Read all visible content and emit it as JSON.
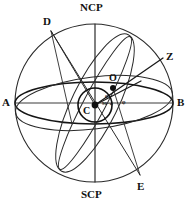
{
  "figure": {
    "type": "celestial-sphere-diagram",
    "background": "#ffffff",
    "stroke_color": "#1a1a1a",
    "canvas": {
      "width": 189,
      "height": 204
    }
  },
  "labels": {
    "ncp": "NCP",
    "scp": "SCP",
    "a": "A",
    "b": "B",
    "c": "C",
    "d": "D",
    "e": "E",
    "o": "O",
    "z": "Z",
    "phi_upper": "φ",
    "phi_right": "φ",
    "ninety_minus_phi": "90−φ"
  },
  "geometry": {
    "sphere": {
      "cx": 94,
      "cy": 103,
      "r": 79
    },
    "inner_circle": {
      "cx": 95,
      "cy": 105,
      "r": 17
    },
    "equator_ellipse": {
      "cx": 94,
      "cy": 103,
      "rx": 79,
      "ry": 21
    },
    "horizon_ellipse": {
      "cx": 94,
      "cy": 103,
      "rx": 79,
      "ry": 27,
      "rotation": -7
    },
    "ecliptic_ellipse": {
      "cx": 95,
      "cy": 103,
      "rx": 76,
      "ry": 22,
      "rotation": -64
    },
    "polar_axis": {
      "x1": 95,
      "y1": 24,
      "x2": 95,
      "y2": 182
    },
    "equator_line": {
      "x1": 16,
      "y1": 103,
      "x2": 172,
      "y2": 103
    },
    "zenith_line": {
      "x1": 95,
      "y1": 105,
      "x2": 163,
      "y2": 58
    },
    "points": {
      "A": {
        "x": 16,
        "y": 103
      },
      "B": {
        "x": 172,
        "y": 103
      },
      "C": {
        "x": 95,
        "y": 105
      },
      "D": {
        "x": 51,
        "y": 31
      },
      "E": {
        "x": 140,
        "y": 175
      },
      "O": {
        "x": 113,
        "y": 88
      },
      "Z": {
        "x": 163,
        "y": 58
      },
      "NCP": {
        "x": 95,
        "y": 24
      },
      "SCP": {
        "x": 95,
        "y": 182
      }
    }
  },
  "label_positions": {
    "ncp": {
      "x": 80,
      "y": 3
    },
    "scp": {
      "x": 80,
      "y": 190
    },
    "a": {
      "x": 2,
      "y": 98
    },
    "b": {
      "x": 177,
      "y": 98
    },
    "c": {
      "x": 84,
      "y": 107
    },
    "d": {
      "x": 43,
      "y": 17
    },
    "e": {
      "x": 138,
      "y": 182
    },
    "o": {
      "x": 110,
      "y": 74
    },
    "z": {
      "x": 166,
      "y": 52
    },
    "phi_upper": {
      "x": 105,
      "y": 95
    },
    "ninety_minus_phi": {
      "x": 103,
      "y": 102
    },
    "phi_right": {
      "x": 121,
      "y": 101
    }
  }
}
